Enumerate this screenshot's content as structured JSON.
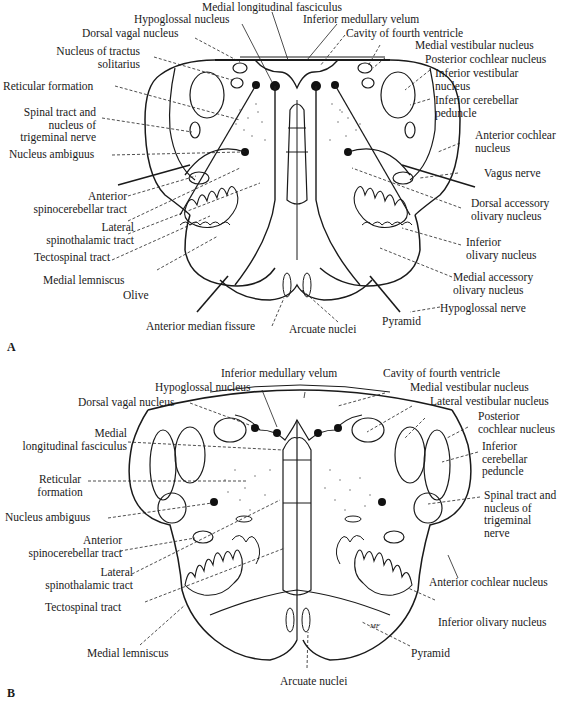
{
  "panels": {
    "A": {
      "letter": "A",
      "labels": {
        "medial_longitudinal_fasciculus": "Medial longitudinal fasciculus",
        "hypoglossal_nucleus": "Hypoglossal nucleus",
        "inferior_medullary_velum": "Inferior medullary velum",
        "dorsal_vagal_nucleus": "Dorsal vagal nucleus",
        "cavity_of_fourth_ventricle": "Cavity of fourth ventricle",
        "nucleus_tractus_solitarius_1": "Nucleus of tractus",
        "nucleus_tractus_solitarius_2": "solitarius",
        "medial_vestibular_nucleus": "Medial vestibular nucleus",
        "posterior_cochlear_nucleus": "Posterior cochlear nucleus",
        "reticular_formation": "Reticular formation",
        "inferior_vestibular_nucleus_1": "Inferior vestibular",
        "inferior_vestibular_nucleus_2": "nucleus",
        "inferior_cerebellar_peduncle_1": "Inferior cerebellar",
        "inferior_cerebellar_peduncle_2": "peduncle",
        "spinal_tract_1": "Spinal tract and",
        "spinal_tract_2": "nucleus of",
        "spinal_tract_3": "trigeminal  nerve",
        "anterior_cochlear_nucleus_1": "Anterior cochlear",
        "anterior_cochlear_nucleus_2": "nucleus",
        "nucleus_ambiguus": "Nucleus ambiguus",
        "vagus_nerve": "Vagus nerve",
        "anterior_spinocerebellar_tract_1": "Anterior",
        "anterior_spinocerebellar_tract_2": "spinocerebellar tract",
        "dorsal_accessory_olivary_1": "Dorsal accessory",
        "dorsal_accessory_olivary_2": "olivary nucleus",
        "lateral_spinothalamic_tract_1": "Lateral",
        "lateral_spinothalamic_tract_2": "spinothalamic tract",
        "inferior_olivary_1": "Inferior",
        "inferior_olivary_2": "olivary nucleus",
        "tectospinal_tract": "Tectospinal tract",
        "medial_lemniscus": "Medial lemniscus",
        "medial_accessory_olivary_1": "Medial accessory",
        "medial_accessory_olivary_2": "olivary nucleus",
        "olive": "Olive",
        "hypoglossal_nerve": "Hypoglossal nerve",
        "pyramid": "Pyramid",
        "anterior_median_fissure": "Anterior median fissure",
        "arcuate_nuclei": "Arcuate nuclei"
      }
    },
    "B": {
      "letter": "B",
      "labels": {
        "inferior_medullary_velum": "Inferior medullary velum",
        "cavity_of_fourth_ventricle": "Cavity of fourth ventricle",
        "hypoglossal_nucleus": "Hypoglossal nucleus",
        "medial_vestibular_nucleus": "Medial vestibular nucleus",
        "dorsal_vagal_nucleus": "Dorsal vagal nucleus",
        "lateral_vestibular_nucleus": "Lateral vestibular nucleus",
        "posterior_cochlear_nucleus_1": "Posterior",
        "posterior_cochlear_nucleus_2": "cochlear nucleus",
        "medial_longitudinal_fasciculus_1": "Medial",
        "medial_longitudinal_fasciculus_2": "longitudinal fasciculus",
        "inferior_cerebellar_peduncle_1": "Inferior",
        "inferior_cerebellar_peduncle_2": "cerebellar",
        "inferior_cerebellar_peduncle_3": "peduncle",
        "reticular_formation_1": "Reticular",
        "reticular_formation_2": "formation",
        "spinal_tract_1": "Spinal tract and",
        "spinal_tract_2": "nucleus of",
        "spinal_tract_3": "trigeminal",
        "spinal_tract_4": "nerve",
        "nucleus_ambiguus": "Nucleus ambiguus",
        "anterior_spinocerebellar_tract_1": "Anterior",
        "anterior_spinocerebellar_tract_2": "spinocerebellar tract",
        "lateral_spinothalamic_tract_1": "Lateral",
        "lateral_spinothalamic_tract_2": "spinothalamic tract",
        "anterior_cochlear_nucleus": "Anterior cochlear nucleus",
        "tectospinal_tract": "Tectospinal tract",
        "inferior_olivary_nucleus": "Inferior olivary nucleus",
        "medial_lemniscus": "Medial lemniscus",
        "pyramid": "Pyramid",
        "arcuate_nuclei": "Arcuate nuclei",
        "artist_mark": "MF"
      }
    }
  }
}
